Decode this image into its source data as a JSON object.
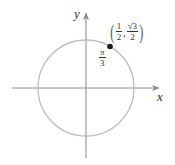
{
  "diagram": {
    "axes": {
      "x_label": "x",
      "y_label": "y"
    },
    "angle_label": {
      "numerator": "π",
      "denominator": "3"
    },
    "point": {
      "x": {
        "numerator": "1",
        "denominator": "2"
      },
      "y": {
        "numerator": "√3",
        "denominator": "2"
      },
      "open_paren": "(",
      "close_paren": ")",
      "comma": ","
    },
    "colors": {
      "circle": "#bdbdbd",
      "axes": "#8a8a8a",
      "point": "#1a1a1a",
      "text": "#333333"
    }
  }
}
